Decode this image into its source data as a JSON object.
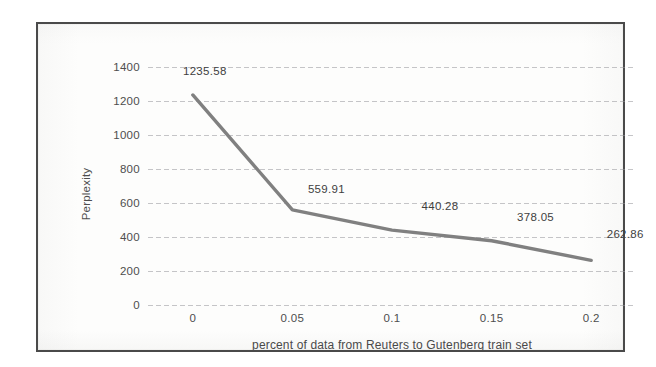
{
  "chart_data": {
    "type": "line",
    "title": "",
    "xlabel": "percent of data from Reuters to Gutenberg train set",
    "ylabel": "Perplexity",
    "x": [
      0,
      0.05,
      0.1,
      0.15,
      0.2
    ],
    "x_tick_labels": [
      "0",
      "0.05",
      "0.1",
      "0.15",
      "0.2"
    ],
    "values": [
      1235.58,
      559.91,
      440.28,
      378.05,
      262.86
    ],
    "point_labels": [
      "1235.58",
      "559.91",
      "440.28",
      "378.05",
      "262.86"
    ],
    "y_tick_labels": [
      "1400",
      "1200",
      "1000",
      "800",
      "600",
      "400",
      "200",
      "0"
    ],
    "y_ticks": [
      1400,
      1200,
      1000,
      800,
      600,
      400,
      200,
      0
    ],
    "ylim": [
      0,
      1400
    ],
    "xlim": [
      -0.0225,
      0.2225
    ],
    "grid": true,
    "legend": false,
    "series_color": "#808080",
    "gridline_color": "#96969b",
    "text_color": "#4e4e4e",
    "frame_color": "#4a4a4a",
    "background_color": "#fdfdfc"
  }
}
